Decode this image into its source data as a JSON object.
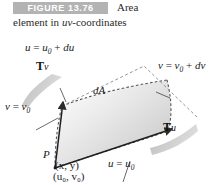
{
  "caption": {
    "badge": "FIGURE 13.76",
    "line1": "Area",
    "line2_prefix": "element in ",
    "line2_italic": "uv",
    "line2_suffix": "-coordinates"
  },
  "colors": {
    "badge_bg": "#b3b3b3",
    "badge_text": "#ffffff",
    "patch_fill_light": "#f2f2f2",
    "patch_fill_dark": "#c9c9c9",
    "outline": "#4d4d4d",
    "text": "#1a1a1a",
    "page_bg": "#ffffff"
  },
  "figure": {
    "region_label": "dA",
    "point_label": "P",
    "point_xy": "(x, y)",
    "point_uv": "(u₀, v₀)",
    "curve_top": {
      "var": "u",
      "eq": "=",
      "value": "u",
      "sub": "0",
      "plus": "+ ",
      "diff": "du"
    },
    "curve_right": {
      "var": "v",
      "eq": "=",
      "value": "v",
      "sub": "0",
      "plus": "+ ",
      "diff": "dv"
    },
    "curve_left": {
      "var": "v",
      "eq": "=",
      "value": "v",
      "sub": "0"
    },
    "curve_bottom": {
      "var": "u",
      "eq": "=",
      "value": "u",
      "sub": "0"
    },
    "vector_v": {
      "symbol": "T",
      "sub": "v"
    },
    "vector_u": {
      "symbol": "T",
      "sub": "u"
    }
  }
}
